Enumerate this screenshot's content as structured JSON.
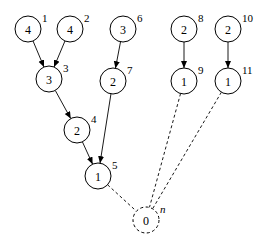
{
  "diagram": {
    "type": "tree",
    "nodes": [
      {
        "id": "1",
        "value": "4",
        "label": "1",
        "x": 28,
        "y": 29,
        "dashed": false
      },
      {
        "id": "2",
        "value": "4",
        "label": "2",
        "x": 70,
        "y": 29,
        "dashed": false
      },
      {
        "id": "3",
        "value": "3",
        "label": "3",
        "x": 49,
        "y": 79,
        "dashed": false
      },
      {
        "id": "4",
        "value": "2",
        "label": "4",
        "x": 77,
        "y": 130,
        "dashed": false
      },
      {
        "id": "5",
        "value": "1",
        "label": "5",
        "x": 98,
        "y": 176,
        "dashed": false
      },
      {
        "id": "6",
        "value": "3",
        "label": "6",
        "x": 123,
        "y": 29,
        "dashed": false
      },
      {
        "id": "7",
        "value": "2",
        "label": "7",
        "x": 113,
        "y": 81,
        "dashed": false
      },
      {
        "id": "8",
        "value": "2",
        "label": "8",
        "x": 184,
        "y": 29,
        "dashed": false
      },
      {
        "id": "9",
        "value": "1",
        "label": "9",
        "x": 184,
        "y": 81,
        "dashed": false
      },
      {
        "id": "10",
        "value": "2",
        "label": "10",
        "x": 228,
        "y": 29,
        "dashed": false
      },
      {
        "id": "11",
        "value": "1",
        "label": "11",
        "x": 228,
        "y": 81,
        "dashed": false
      },
      {
        "id": "n",
        "value": "0",
        "label": "n",
        "x": 146,
        "y": 220,
        "dashed": true
      }
    ],
    "edges": [
      {
        "from": "1",
        "to": "3",
        "style": "solid",
        "arrow": true
      },
      {
        "from": "2",
        "to": "3",
        "style": "solid",
        "arrow": true
      },
      {
        "from": "3",
        "to": "4",
        "style": "solid",
        "arrow": true
      },
      {
        "from": "4",
        "to": "5",
        "style": "solid",
        "arrow": true
      },
      {
        "from": "6",
        "to": "7",
        "style": "solid",
        "arrow": true
      },
      {
        "from": "7",
        "to": "5",
        "style": "solid",
        "arrow": true
      },
      {
        "from": "8",
        "to": "9",
        "style": "solid",
        "arrow": true
      },
      {
        "from": "10",
        "to": "11",
        "style": "solid",
        "arrow": true
      },
      {
        "from": "5",
        "to": "n",
        "style": "dashed",
        "arrow": false
      },
      {
        "from": "9",
        "to": "n",
        "style": "dashed",
        "arrow": false
      },
      {
        "from": "11",
        "to": "n",
        "style": "dashed",
        "arrow": false
      }
    ],
    "radius": 13
  }
}
